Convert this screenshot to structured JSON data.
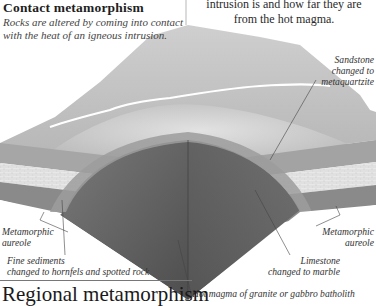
{
  "header": {
    "title": "Contact metamorphism",
    "subtitle": "Rocks are altered by coming into contact with the heat of an igneous intrusion."
  },
  "intro_text": {
    "line1": "intrusion is and how far they are",
    "line2": "from the hot magma."
  },
  "labels": {
    "sandstone": {
      "line1": "Sandstone",
      "line2": "changed to",
      "line3": "metaquartzite"
    },
    "aureole_left": {
      "line1": "Metamorphic",
      "line2": "aureole"
    },
    "aureole_right": {
      "line1": "Metamorphic",
      "line2": "aureole"
    },
    "fine_sediments": {
      "line1": "Fine sediments",
      "line2": "changed to hornfels and spotted rock"
    },
    "limestone": {
      "line1": "Limestone",
      "line2": "changed to marble"
    },
    "magma": "Hot magma of granite or gabbro batholith"
  },
  "footer": {
    "heading": "Regional metamorphism"
  },
  "colors": {
    "surface_light": "#d9d9d9",
    "surface_mid": "#bdbdbd",
    "aureole": "#9a9a9a",
    "marble_band": "#e6e6e6",
    "lower_strata": "#8c8c8c",
    "magma": "#5a5a5a"
  }
}
